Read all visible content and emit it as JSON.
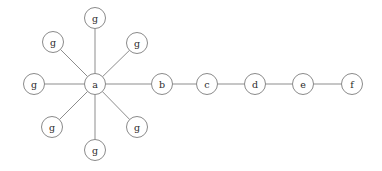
{
  "figure": {
    "type": "node-link-graph",
    "title": "",
    "background_color": "#ffffff",
    "width": 382,
    "height": 171
  },
  "style": {
    "node_fill": "#ffffff",
    "node_stroke": "#8a8a8a",
    "node_radius": 10.5,
    "edge_color": "#8d8d8d",
    "edge_width": 1,
    "label_color": "#2b2b2b"
  },
  "graph": {
    "node_count": 13,
    "edge_count": 12,
    "nodes": [
      {
        "id": "a",
        "label": "a",
        "x": 95,
        "y": 84
      },
      {
        "id": "b",
        "label": "b",
        "x": 162,
        "y": 84
      },
      {
        "id": "c",
        "label": "c",
        "x": 207,
        "y": 84
      },
      {
        "id": "d",
        "label": "d",
        "x": 255,
        "y": 84
      },
      {
        "id": "e",
        "label": "e",
        "x": 303,
        "y": 84
      },
      {
        "id": "f",
        "label": "f",
        "x": 352,
        "y": 84
      },
      {
        "id": "g1",
        "label": "g",
        "x": 95,
        "y": 18
      },
      {
        "id": "g2",
        "label": "g",
        "x": 53,
        "y": 42
      },
      {
        "id": "g3",
        "label": "g",
        "x": 137,
        "y": 43
      },
      {
        "id": "g4",
        "label": "g",
        "x": 34,
        "y": 84
      },
      {
        "id": "g5",
        "label": "g",
        "x": 52,
        "y": 127
      },
      {
        "id": "g6",
        "label": "g",
        "x": 137,
        "y": 127
      },
      {
        "id": "g7",
        "label": "g",
        "x": 95,
        "y": 150
      }
    ],
    "edges": [
      {
        "source": "a",
        "target": "g1"
      },
      {
        "source": "a",
        "target": "g2"
      },
      {
        "source": "a",
        "target": "g3"
      },
      {
        "source": "a",
        "target": "g4"
      },
      {
        "source": "a",
        "target": "g5"
      },
      {
        "source": "a",
        "target": "g6"
      },
      {
        "source": "a",
        "target": "g7"
      },
      {
        "source": "a",
        "target": "b"
      },
      {
        "source": "b",
        "target": "c"
      },
      {
        "source": "c",
        "target": "d"
      },
      {
        "source": "d",
        "target": "e"
      },
      {
        "source": "e",
        "target": "f"
      }
    ]
  }
}
